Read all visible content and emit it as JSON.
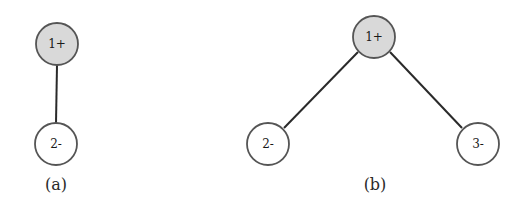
{
  "figures": [
    {
      "id": "a",
      "caption": "(a)",
      "nodes": [
        {
          "label": "1+",
          "shaded": true
        },
        {
          "label": "2-",
          "shaded": false
        }
      ],
      "edges": [
        [
          "1+",
          "2-"
        ]
      ]
    },
    {
      "id": "b",
      "caption": "(b)",
      "nodes": [
        {
          "label": "1+",
          "shaded": true
        },
        {
          "label": "2-",
          "shaded": false
        },
        {
          "label": "3-",
          "shaded": false
        }
      ],
      "edges": [
        [
          "1+",
          "2-"
        ],
        [
          "1+",
          "3-"
        ]
      ]
    }
  ],
  "colors": {
    "shaded_node_fill": "#d9d9d9",
    "node_stroke": "#555555",
    "edge": "#2a2a2a"
  }
}
